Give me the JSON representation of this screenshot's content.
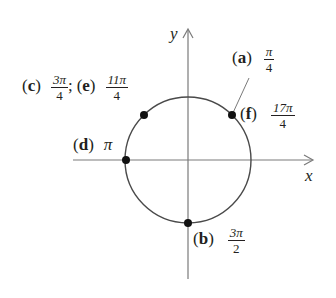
{
  "diagram": {
    "type": "unit-circle-angle-positions",
    "axes": {
      "x_label": "x",
      "y_label": "y"
    },
    "circle": {
      "center": [
        188,
        160
      ],
      "radius": 63,
      "stroke": "#4a4a4a"
    },
    "colors": {
      "ink": "#231f20",
      "axis": "#7a7a7a",
      "point": "#111111"
    },
    "points": [
      {
        "id": "a",
        "tag": "a",
        "angle_num": "π",
        "angle_den": "4",
        "position": "first quadrant, 45°"
      },
      {
        "id": "b",
        "tag": "b",
        "angle_num": "3π",
        "angle_den": "2",
        "position": "negative y-axis"
      },
      {
        "id": "c",
        "tag": "c",
        "angle_num": "3π",
        "angle_den": "4",
        "position": "second quadrant, 135°"
      },
      {
        "id": "d",
        "tag": "d",
        "angle": "π",
        "position": "negative x-axis"
      },
      {
        "id": "e",
        "tag": "e",
        "angle_num": "11π",
        "angle_den": "4",
        "position": "second quadrant, coterminal with 3π/4"
      },
      {
        "id": "f",
        "tag": "f",
        "angle_num": "17π",
        "angle_den": "4",
        "position": "first quadrant, coterminal with π/4"
      }
    ],
    "labels": {
      "ce_separator": ";",
      "paren_open": "(",
      "paren_close": ")"
    }
  }
}
